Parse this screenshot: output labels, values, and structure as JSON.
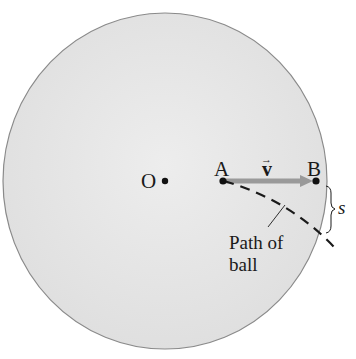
{
  "diagram": {
    "colors": {
      "disk_fill": "#e4e4e4",
      "disk_edge": "#8a8a8a",
      "arrow": "#9a9a9a",
      "ink": "#1a1a1a"
    },
    "labels": {
      "center": "O",
      "point_a": "A",
      "point_b": "B",
      "velocity": "v",
      "velocity_arrow": "→",
      "arc_length": "s",
      "path_line1": "Path of",
      "path_line2": "ball"
    }
  }
}
